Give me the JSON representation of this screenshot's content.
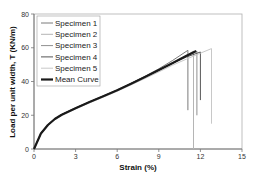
{
  "chart_data": {
    "type": "line",
    "title": "",
    "xlabel": "Strain (%)",
    "ylabel": "Load per unit width, T (KN/m)",
    "xlim": [
      0,
      15
    ],
    "ylim": [
      0,
      80
    ],
    "xticks": [
      "0",
      "3",
      "6",
      "9",
      "12",
      "15"
    ],
    "yticks": [
      "0",
      "20",
      "40",
      "60",
      "80"
    ],
    "grid": false,
    "legend_position": "upper-left",
    "series": [
      {
        "name": "Specimen 1",
        "color": "#7a7a7a",
        "width": 1,
        "peak_x": 11.1,
        "peak_y": 58.5,
        "drop_to_y": 23,
        "x": [
          0,
          0.5,
          1,
          1.5,
          2,
          3,
          4,
          5,
          6,
          7,
          8,
          9,
          10,
          11.1
        ],
        "y": [
          0,
          9.5,
          14.5,
          18,
          20.5,
          24.5,
          28,
          31.5,
          35,
          39,
          43,
          47.5,
          52.5,
          58.5
        ]
      },
      {
        "name": "Specimen 2",
        "color": "#b5b5b5",
        "width": 1,
        "peak_x": 11.5,
        "peak_y": 58.0,
        "drop_to_y": 0,
        "x": [
          0,
          0.5,
          1,
          1.5,
          2,
          3,
          4,
          5,
          6,
          7,
          8,
          9,
          10,
          11,
          11.5
        ],
        "y": [
          0,
          9,
          14,
          17.5,
          20,
          24,
          27.5,
          31,
          34.5,
          38.5,
          42.5,
          46.5,
          51,
          55.5,
          58
        ]
      },
      {
        "name": "Specimen 3",
        "color": "#909090",
        "width": 1,
        "peak_x": 11.75,
        "peak_y": 58.0,
        "drop_to_y": 20,
        "x": [
          0,
          0.5,
          1,
          1.5,
          2,
          3,
          4,
          5,
          6,
          7,
          8,
          9,
          10,
          11,
          11.75
        ],
        "y": [
          0,
          9.2,
          14.2,
          17.8,
          20.3,
          24.2,
          27.8,
          31.2,
          34.8,
          38.7,
          42.7,
          46.7,
          51,
          55,
          58
        ]
      },
      {
        "name": "Specimen 4",
        "color": "#555555",
        "width": 1,
        "peak_x": 12.0,
        "peak_y": 57.5,
        "drop_to_y": 29,
        "x": [
          0,
          0.5,
          1,
          1.5,
          2,
          3,
          4,
          5,
          6,
          7,
          8,
          9,
          10,
          11,
          12
        ],
        "y": [
          0,
          9.3,
          14.3,
          17.9,
          20.4,
          24.3,
          27.9,
          31.3,
          34.9,
          38.8,
          42.8,
          46.8,
          50.8,
          54.5,
          57.5
        ]
      },
      {
        "name": "Specimen 5",
        "color": "#c8c8c8",
        "width": 1,
        "peak_x": 12.8,
        "peak_y": 59.5,
        "drop_to_y": 15,
        "x": [
          0,
          0.5,
          1,
          1.5,
          2,
          3,
          4,
          5,
          6,
          7,
          8,
          9,
          10,
          11,
          12,
          12.8
        ],
        "y": [
          0,
          8.8,
          13.8,
          17.3,
          19.8,
          23.8,
          27.3,
          30.7,
          34.2,
          38,
          41.8,
          45.7,
          49.7,
          53.3,
          56.8,
          59.5
        ]
      },
      {
        "name": "Mean Curve",
        "color": "#1a1a1a",
        "width": 2.2,
        "x": [
          0,
          0.5,
          1,
          1.5,
          2,
          3,
          4,
          5,
          6,
          7,
          8,
          9,
          10,
          11,
          11.7
        ],
        "y": [
          0,
          9.2,
          14.2,
          17.8,
          20.3,
          24.2,
          27.8,
          31.2,
          34.8,
          38.7,
          42.7,
          46.8,
          51,
          55.2,
          58
        ]
      }
    ]
  }
}
